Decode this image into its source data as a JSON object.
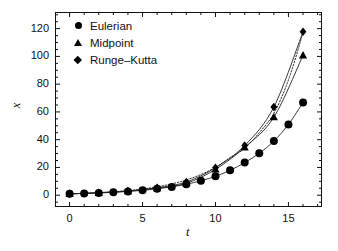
{
  "figure": {
    "background": "#ffffff",
    "frame_color": "#111111"
  },
  "axis_titles": {
    "x": "t",
    "y": "x"
  },
  "legend": {
    "position": "top-left-inside",
    "entries": [
      {
        "label": "Eulerian",
        "marker": "circle-marker-icon"
      },
      {
        "label": "Midpoint",
        "marker": "triangle-marker-icon"
      },
      {
        "label": "Runge–Kutta",
        "marker": "diamond-marker-icon"
      }
    ]
  },
  "ticks": {
    "x_labels": [
      "0",
      "5",
      "10",
      "15"
    ],
    "y_labels": [
      "0",
      "20",
      "40",
      "60",
      "80",
      "100",
      "120"
    ]
  },
  "chart_data": {
    "type": "line",
    "title": "",
    "xlabel": "t",
    "ylabel": "x",
    "xlim": [
      -1,
      17.3
    ],
    "ylim": [
      -8.5,
      132
    ],
    "xticks": [
      0,
      5,
      10,
      15
    ],
    "yticks": [
      0,
      20,
      40,
      60,
      80,
      100,
      120
    ],
    "xminor_step": 1,
    "yminor_step": 5,
    "grid": false,
    "legend_position": "upper left",
    "series": [
      {
        "name": "Eulerian",
        "marker": "circle",
        "line": "solid",
        "color": "#222222",
        "x": [
          0,
          1,
          2,
          3,
          4,
          5,
          6,
          7,
          8,
          9,
          10,
          11,
          12,
          13,
          14,
          15,
          16
        ],
        "y": [
          1.0,
          1.3,
          1.6,
          2.1,
          2.7,
          3.5,
          4.6,
          6.0,
          7.9,
          10.4,
          13.6,
          17.9,
          23.5,
          30.2,
          39.0,
          51.0,
          66.8
        ]
      },
      {
        "name": "Midpoint",
        "marker": "triangle",
        "line": "solid",
        "color": "#222222",
        "x": [
          0,
          2,
          4,
          6,
          8,
          10,
          12,
          14,
          16
        ],
        "y": [
          1.0,
          1.7,
          2.9,
          5.0,
          8.6,
          18.6,
          34.5,
          56.2,
          100.8
        ]
      },
      {
        "name": "Runge–Kutta",
        "marker": "diamond",
        "line": "solid",
        "color": "#222222",
        "x": [
          0,
          2,
          4,
          6,
          8,
          10,
          12,
          14,
          16
        ],
        "y": [
          1.0,
          1.8,
          3.1,
          5.4,
          9.5,
          19.8,
          35.8,
          63.5,
          117.8
        ]
      },
      {
        "name": "exact-reference",
        "marker": "none",
        "line": "dotted",
        "color": "#222222",
        "x": [
          0,
          1,
          2,
          3,
          4,
          5,
          6,
          7,
          8,
          9,
          10,
          11,
          12,
          13,
          14,
          15,
          16
        ],
        "y": [
          1.0,
          1.35,
          1.82,
          2.46,
          3.32,
          4.48,
          6.05,
          8.17,
          11.02,
          14.88,
          20.09,
          27.11,
          33.8,
          45.0,
          59.0,
          83.0,
          117.0
        ]
      }
    ]
  }
}
